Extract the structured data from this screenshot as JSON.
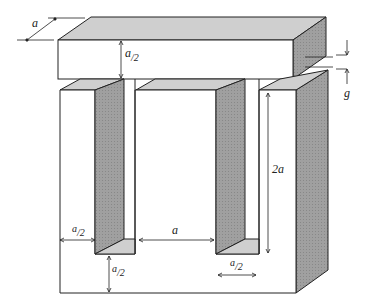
{
  "diagram": {
    "colors": {
      "top_face": "#cfcfcf",
      "side_face": "#9a9a9a",
      "front_face": "#ffffff",
      "stroke": "#222222"
    },
    "labels": {
      "depth": "a",
      "yoke_height_num": "a",
      "yoke_height_den": "2",
      "gap": "g",
      "window_height": "2a",
      "leg_width_num": "a",
      "leg_width_den": "2",
      "window_width": "a",
      "bottom_yoke_num": "a",
      "bottom_yoke_den": "2",
      "outer_leg_num": "a",
      "outer_leg_den": "2"
    }
  }
}
